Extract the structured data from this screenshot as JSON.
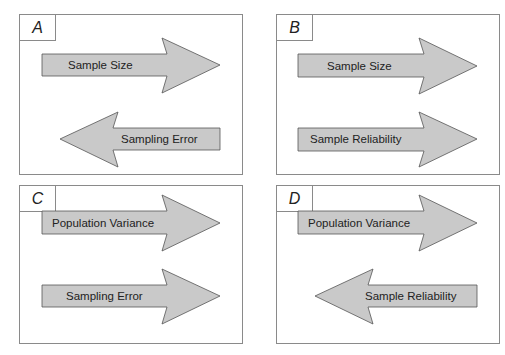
{
  "panels": [
    {
      "id": "A",
      "label": "A",
      "arrows": [
        {
          "label": "Sample Size",
          "direction": "right"
        },
        {
          "label": "Sampling Error",
          "direction": "left"
        }
      ]
    },
    {
      "id": "B",
      "label": "B",
      "arrows": [
        {
          "label": "Sample Size",
          "direction": "right"
        },
        {
          "label": "Sample Reliability",
          "direction": "right"
        }
      ]
    },
    {
      "id": "C",
      "label": "C",
      "arrows": [
        {
          "label": "Population Variance",
          "direction": "right"
        },
        {
          "label": "Sampling Error",
          "direction": "right"
        }
      ]
    },
    {
      "id": "D",
      "label": "D",
      "arrows": [
        {
          "label": "Population Variance",
          "direction": "right"
        },
        {
          "label": "Sample Reliability",
          "direction": "left"
        }
      ]
    }
  ],
  "colors": {
    "arrow_fill": "#c9c9c9",
    "arrow_stroke": "#555555",
    "border": "#8a8a8a"
  }
}
